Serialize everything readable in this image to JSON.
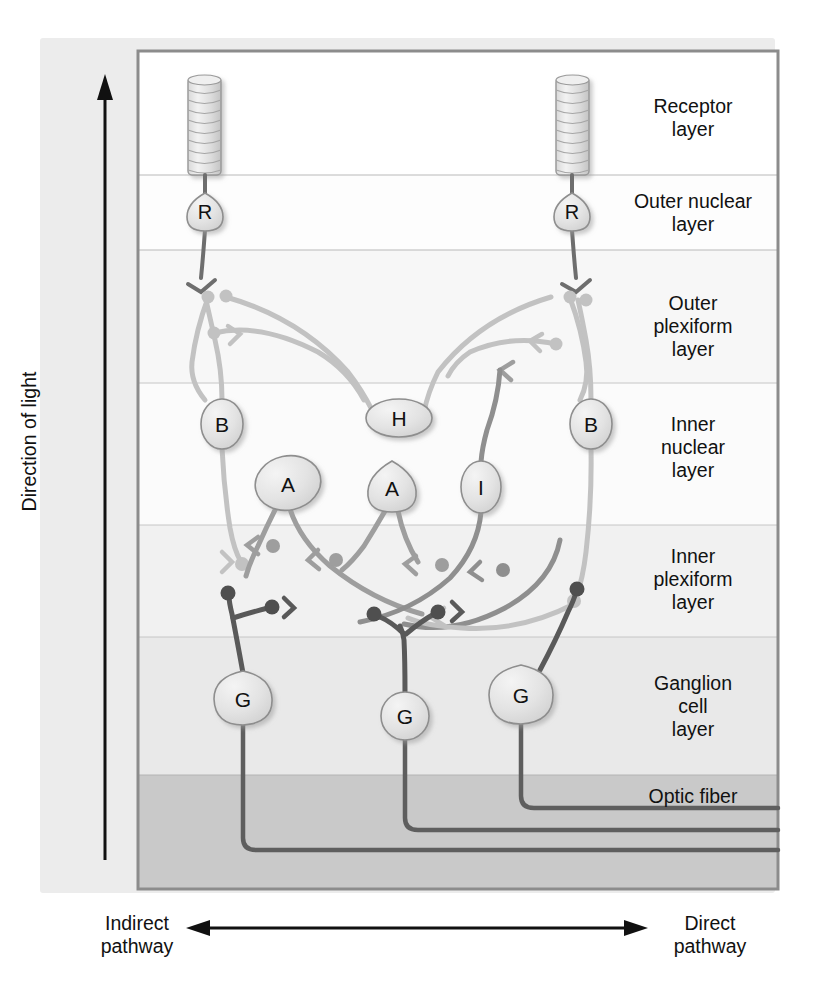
{
  "figure": {
    "direction_label": "Direction of light",
    "pathway_left": "Indirect\npathway",
    "pathway_left_line1": "Indirect",
    "pathway_left_line2": "pathway",
    "pathway_right_line1": "Direct",
    "pathway_right_line2": "pathway"
  },
  "layers": [
    {
      "id": "receptor",
      "line1": "Receptor",
      "line2": "layer",
      "line3": "",
      "y_top": 50,
      "y_bottom": 175,
      "fill": "#ffffff"
    },
    {
      "id": "outer-nuclear",
      "line1": "Outer nuclear",
      "line2": "layer",
      "line3": "",
      "y_top": 175,
      "y_bottom": 250,
      "fill": "#fdfdfd"
    },
    {
      "id": "outer-plexiform",
      "line1": "Outer",
      "line2": "plexiform",
      "line3": "layer",
      "y_top": 250,
      "y_bottom": 383,
      "fill": "#f6f6f6"
    },
    {
      "id": "inner-nuclear",
      "line1": "Inner",
      "line2": "nuclear",
      "line3": "layer",
      "y_top": 383,
      "y_bottom": 525,
      "fill": "#fafafa"
    },
    {
      "id": "inner-plexiform",
      "line1": "Inner",
      "line2": "plexiform",
      "line3": "layer",
      "y_top": 525,
      "y_bottom": 637,
      "fill": "#f0f0f0"
    },
    {
      "id": "ganglion-cell",
      "line1": "Ganglion",
      "line2": "cell",
      "line3": "layer",
      "y_top": 637,
      "y_bottom": 775,
      "fill": "#e8e8e8"
    },
    {
      "id": "optic-fiber",
      "line1": "Optic fiber",
      "line2": "",
      "line3": "",
      "y_top": 775,
      "y_bottom": 890,
      "fill": "#c9c9c9"
    }
  ],
  "cells": [
    {
      "label": "R",
      "name": "photoreceptor-left",
      "cx": 205,
      "cy": 212,
      "rx": 20,
      "ry": 18
    },
    {
      "label": "R",
      "name": "photoreceptor-right",
      "cx": 572,
      "cy": 212,
      "rx": 20,
      "ry": 18
    },
    {
      "label": "B",
      "name": "bipolar-left",
      "cx": 222,
      "cy": 424,
      "rx": 21,
      "ry": 24
    },
    {
      "label": "B",
      "name": "bipolar-right",
      "cx": 591,
      "cy": 424,
      "rx": 21,
      "ry": 24
    },
    {
      "label": "H",
      "name": "horizontal-cell",
      "cx": 399,
      "cy": 418,
      "rx": 32,
      "ry": 18
    },
    {
      "label": "A",
      "name": "amacrine-left",
      "cx": 288,
      "cy": 483,
      "rx": 32,
      "ry": 26
    },
    {
      "label": "A",
      "name": "amacrine-right",
      "cx": 392,
      "cy": 487,
      "rx": 26,
      "ry": 24
    },
    {
      "label": "I",
      "name": "interplexiform-cell",
      "cx": 481,
      "cy": 487,
      "rx": 19,
      "ry": 25
    },
    {
      "label": "G",
      "name": "ganglion-left",
      "cx": 243,
      "cy": 699,
      "rx": 28,
      "ry": 26
    },
    {
      "label": "G",
      "name": "ganglion-middle",
      "cx": 405,
      "cy": 716,
      "rx": 23,
      "ry": 23
    },
    {
      "label": "G",
      "name": "ganglion-right",
      "cx": 521,
      "cy": 695,
      "rx": 31,
      "ry": 29
    }
  ],
  "colors": {
    "panel_background": "#ececec",
    "page_background": "#ffffff",
    "frame_border": "#8c8c8c",
    "text": "#111111",
    "cell_fill": "#e4e4e4",
    "cell_stroke": "#8e8e8e",
    "neurite_dark": "#5a5a5a",
    "neurite_mid": "#9a9a9a",
    "neurite_light": "#c4c4c4",
    "axon_dark": "#4a4a4a",
    "optic_fiber_fill": "#c9c9c9"
  }
}
